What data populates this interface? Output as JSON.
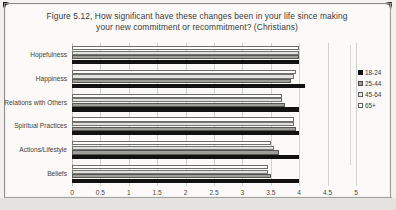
{
  "chart_data": {
    "type": "bar",
    "orientation": "horizontal",
    "title": "Figure 5.12, How significant have these changes been in your life since making your new commitment or recommitment? (Christians)",
    "title_line1": "Figure 5.12, How significant have these changes been in your life since making",
    "title_line2": "your new commitment or recommitment? (Christians)",
    "xlabel": "",
    "ylabel": "",
    "xlim": [
      0,
      5
    ],
    "xticks": [
      "0",
      "0.5",
      "1",
      "1.5",
      "2",
      "2.5",
      "3",
      "3.5",
      "4",
      "4.5",
      "5"
    ],
    "xtick_values": [
      0,
      0.5,
      1,
      1.5,
      2,
      2.5,
      3,
      3.5,
      4,
      4.5,
      5
    ],
    "grid": true,
    "legend_position": "right",
    "categories": [
      "Hopefulness",
      "Happiness",
      "Relations with Others",
      "Spiritual Practices",
      "Actions/Lifestyle",
      "Beliefs"
    ],
    "series": [
      {
        "name": "65+",
        "color": "#ffffff",
        "values": [
          4.0,
          3.95,
          3.7,
          3.9,
          3.5,
          3.45
        ]
      },
      {
        "name": "45-64",
        "color": "#e6e6e2",
        "values": [
          4.0,
          3.9,
          3.7,
          3.9,
          3.55,
          3.45
        ]
      },
      {
        "name": "25-44",
        "color": "#9d9d99",
        "values": [
          4.0,
          3.85,
          3.75,
          3.95,
          3.65,
          3.5
        ]
      },
      {
        "name": "18-24",
        "color": "#101010",
        "values": [
          4.0,
          4.1,
          4.0,
          4.0,
          4.0,
          4.0
        ]
      }
    ]
  }
}
